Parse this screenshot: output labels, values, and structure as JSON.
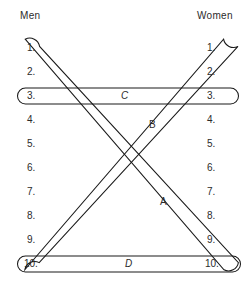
{
  "diagram": {
    "background_color": "#ffffff",
    "stroke_color": "#1a1a1a",
    "text_color": "#2b2b2b",
    "columns": {
      "left": {
        "header": "Men"
      },
      "right": {
        "header": "Women"
      }
    },
    "ranks": {
      "left": [
        "1.",
        "2.",
        "3.",
        "4.",
        "5.",
        "6.",
        "7.",
        "8.",
        "9.",
        "10."
      ],
      "right": [
        "1.",
        "2.",
        "3.",
        "4.",
        "5.",
        "6.",
        "7.",
        "8.",
        "9.",
        "10."
      ]
    },
    "pairings": [
      {
        "label": "A",
        "shape": "diagonal-ellipse",
        "from": "Men 10",
        "to": "Women 1",
        "label_x": 160,
        "label_y": 196
      },
      {
        "label": "B",
        "shape": "diagonal-ellipse",
        "from": "Men 1",
        "to": "Women 10",
        "label_x": 149,
        "label_y": 119
      },
      {
        "label": "C",
        "shape": "horizontal-ellipse",
        "from": "Men 3",
        "to": "Women 3",
        "label_x": 121,
        "label_y": 90
      },
      {
        "label": "D",
        "shape": "horizontal-ellipse",
        "from": "Men 10",
        "to": "Women 10",
        "label_x": 125,
        "label_y": 258
      }
    ]
  }
}
